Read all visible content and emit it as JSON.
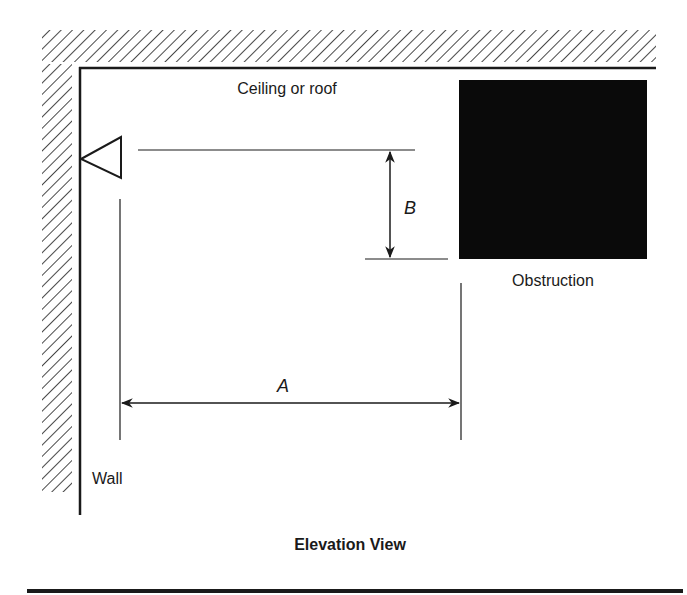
{
  "diagram": {
    "title": "Elevation View",
    "labels": {
      "ceiling": "Ceiling or roof",
      "obstruction": "Obstruction",
      "wall": "Wall",
      "dimension_a": "A",
      "dimension_b": "B"
    },
    "colors": {
      "line": "#1a1a1a",
      "obstruction_fill": "#0a0a0a",
      "background": "#ffffff"
    }
  }
}
